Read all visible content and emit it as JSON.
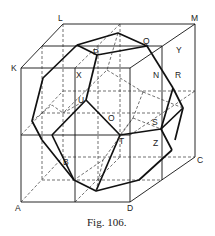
{
  "figure": {
    "caption": "Fig. 106.",
    "labels": {
      "L": "L",
      "M": "M",
      "K": "K",
      "P": "P",
      "Q": "Q",
      "Y": "Y",
      "X": "X",
      "N": "N",
      "R": "R",
      "U": "U",
      "O": "O",
      "S": "S",
      "T": "T",
      "Z": "Z",
      "B": "B",
      "C": "C",
      "A": "A",
      "D": "D"
    }
  }
}
